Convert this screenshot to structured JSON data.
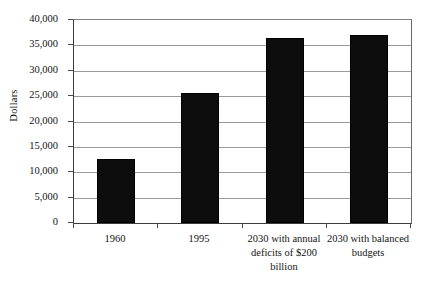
{
  "chart_data": {
    "type": "bar",
    "title": "",
    "subtitle": "",
    "xlabel": "",
    "ylabel": "Dollars",
    "categories": [
      "1960",
      "1995",
      "2030 with annual deficits of $200 billion",
      "2030 with balanced budgets"
    ],
    "category_lines": [
      [
        "1960"
      ],
      [
        "1995"
      ],
      [
        "2030 with annual",
        "deficits of $200",
        "billion"
      ],
      [
        "2030 with balanced",
        "budgets"
      ]
    ],
    "values": [
      12600,
      25600,
      36400,
      37000
    ],
    "ylim": [
      0,
      40000
    ],
    "ytick_values": [
      40000,
      35000,
      30000,
      25000,
      20000,
      15000,
      10000,
      5000,
      0
    ],
    "ytick_labels": [
      "40,000",
      "35,000",
      "30,000",
      "25,000",
      "20,000",
      "15,000",
      "10,000",
      "5,000",
      "0"
    ],
    "grid": true,
    "grid_axis": "y",
    "legend": false,
    "legend_position": "none",
    "bar_color": "#0d0d0d",
    "grid_color": "#9a9a9a",
    "axis_color": "#3c3c3c",
    "background_color": "#ffffff"
  }
}
